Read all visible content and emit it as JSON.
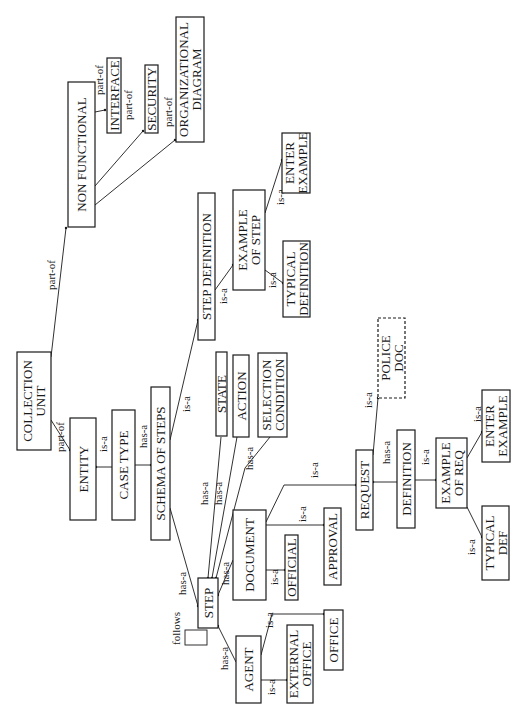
{
  "diagram": {
    "type": "semantic-network",
    "orientation": "rotated-90-ccw",
    "colors": {
      "ink": "#1a1a1a",
      "background": "#ffffff"
    },
    "nodes": [
      {
        "id": "non-functional",
        "lines": [
          "NON    FUNCTIONAL"
        ],
        "x": 68,
        "y": 82,
        "w": 27,
        "h": 145
      },
      {
        "id": "interface",
        "lines": [
          "INTERFACE"
        ],
        "x": 107,
        "y": 58,
        "w": 14,
        "h": 75
      },
      {
        "id": "security",
        "lines": [
          "SECURITY"
        ],
        "x": 145,
        "y": 65,
        "w": 13,
        "h": 68
      },
      {
        "id": "organizational-diagram",
        "lines": [
          "ORGANIZATIONAL",
          "DIAGRAM"
        ],
        "x": 176,
        "y": 17,
        "w": 28,
        "h": 125
      },
      {
        "id": "collection-unit",
        "lines": [
          "COLLECTION",
          "UNIT"
        ],
        "x": 17,
        "y": 352,
        "w": 34,
        "h": 98
      },
      {
        "id": "entity",
        "lines": [
          "ENTITY"
        ],
        "x": 70,
        "y": 418,
        "w": 26,
        "h": 102
      },
      {
        "id": "case-type",
        "lines": [
          "CASE  TYPE"
        ],
        "x": 112,
        "y": 410,
        "w": 23,
        "h": 110
      },
      {
        "id": "schema-of-steps",
        "lines": [
          "SCHEMA  OF  STEPS"
        ],
        "x": 151,
        "y": 387,
        "w": 19,
        "h": 153
      },
      {
        "id": "step-definition",
        "lines": [
          "STEP    DEFINITION"
        ],
        "x": 198,
        "y": 193,
        "w": 17,
        "h": 147
      },
      {
        "id": "example-of-step",
        "lines": [
          "EXAMPLE",
          "OF  STEP"
        ],
        "x": 233,
        "y": 190,
        "w": 32,
        "h": 100
      },
      {
        "id": "enter-example-step",
        "lines": [
          "ENTER",
          "EXAMPLE"
        ],
        "x": 282,
        "y": 133,
        "w": 28,
        "h": 60
      },
      {
        "id": "typical-definition",
        "lines": [
          "TYPICAL",
          "DEFINITION"
        ],
        "x": 283,
        "y": 241,
        "w": 27,
        "h": 76
      },
      {
        "id": "state",
        "lines": [
          "STATE"
        ],
        "x": 216,
        "y": 352,
        "w": 11,
        "h": 84
      },
      {
        "id": "action",
        "lines": [
          "ACTION"
        ],
        "x": 233,
        "y": 355,
        "w": 16,
        "h": 82
      },
      {
        "id": "selection-condition",
        "lines": [
          "SELECTION",
          "CONDITION"
        ],
        "x": 258,
        "y": 353,
        "w": 29,
        "h": 84
      },
      {
        "id": "police-doc",
        "lines": [
          "POLICE",
          "DOC"
        ],
        "x": 378,
        "y": 318,
        "w": 27,
        "h": 80,
        "dashed": true
      },
      {
        "id": "request",
        "lines": [
          "REQUEST"
        ],
        "x": 356,
        "y": 450,
        "w": 17,
        "h": 80
      },
      {
        "id": "definition",
        "lines": [
          "DEFINITION"
        ],
        "x": 397,
        "y": 430,
        "w": 18,
        "h": 98
      },
      {
        "id": "example-of-req",
        "lines": [
          "EXAMPLE",
          "OF REQ"
        ],
        "x": 436,
        "y": 438,
        "w": 31,
        "h": 70
      },
      {
        "id": "enter-example-req",
        "lines": [
          "ENTER",
          "EXAMPLE"
        ],
        "x": 482,
        "y": 390,
        "w": 28,
        "h": 72
      },
      {
        "id": "typical-def",
        "lines": [
          "TYPICAL",
          "DEF"
        ],
        "x": 482,
        "y": 506,
        "w": 27,
        "h": 74
      },
      {
        "id": "document",
        "lines": [
          "DOCUMENT"
        ],
        "x": 233,
        "y": 510,
        "w": 33,
        "h": 90
      },
      {
        "id": "official",
        "lines": [
          "OFFICIAL"
        ],
        "x": 285,
        "y": 535,
        "w": 13,
        "h": 65
      },
      {
        "id": "approval",
        "lines": [
          "APPROVAL"
        ],
        "x": 324,
        "y": 508,
        "w": 17,
        "h": 77
      },
      {
        "id": "step",
        "lines": [
          "STEP"
        ],
        "x": 198,
        "y": 578,
        "w": 20,
        "h": 50
      },
      {
        "id": "agent",
        "lines": [
          "AGENT"
        ],
        "x": 236,
        "y": 636,
        "w": 25,
        "h": 67
      },
      {
        "id": "external-office",
        "lines": [
          "EXTERNAL",
          "OFFICE"
        ],
        "x": 287,
        "y": 625,
        "w": 26,
        "h": 78
      },
      {
        "id": "office",
        "lines": [
          "OFFICE"
        ],
        "x": 324,
        "y": 610,
        "w": 19,
        "h": 60
      }
    ],
    "edges": [
      {
        "label": "part-of",
        "points": [
          [
            95,
            112
          ],
          [
            105,
            110
          ]
        ],
        "lx": 103,
        "ly": 95
      },
      {
        "label": "part-of",
        "points": [
          [
            95,
            186
          ],
          [
            143,
            131
          ]
        ],
        "lx": 132,
        "ly": 120
      },
      {
        "label": "part-of",
        "points": [
          [
            95,
            205
          ],
          [
            175,
            140
          ]
        ],
        "lx": 172,
        "ly": 127
      },
      {
        "label": "part-of",
        "points": [
          [
            51,
            357
          ],
          [
            66,
            228
          ]
        ],
        "lx": 55,
        "ly": 290
      },
      {
        "label": "part-of",
        "points": [
          [
            51,
            420
          ],
          [
            70,
            450
          ]
        ],
        "lx": 64,
        "ly": 452
      },
      {
        "label": "is-a",
        "points": [
          [
            112,
            467
          ],
          [
            96,
            467
          ]
        ],
        "lx": 107,
        "ly": 452
      },
      {
        "label": "has-a",
        "points": [
          [
            135,
            465
          ],
          [
            151,
            465
          ]
        ],
        "lx": 147,
        "ly": 448
      },
      {
        "label": "is-a",
        "points": [
          [
            170,
            440
          ],
          [
            198,
            320
          ]
        ],
        "lx": 190,
        "ly": 412
      },
      {
        "label": "is-a",
        "points": [
          [
            215,
            290
          ],
          [
            233,
            265
          ]
        ],
        "lx": 227,
        "ly": 304
      },
      {
        "label": "is-a",
        "points": [
          [
            265,
            213
          ],
          [
            282,
            160
          ]
        ],
        "lx": 284,
        "ly": 205
      },
      {
        "label": "is-a",
        "points": [
          [
            265,
            270
          ],
          [
            283,
            283
          ]
        ],
        "lx": 276,
        "ly": 288
      },
      {
        "label": "has-a",
        "points": [
          [
            170,
            508
          ],
          [
            198,
            606
          ]
        ],
        "lx": 186,
        "ly": 595
      },
      {
        "label": "has-a",
        "points": [
          [
            221,
            437
          ],
          [
            208,
            578
          ]
        ],
        "lx": 208,
        "ly": 505
      },
      {
        "label": "has-a",
        "points": [
          [
            237,
            437
          ],
          [
            212,
            578
          ]
        ],
        "lx": 222,
        "ly": 505
      },
      {
        "label": "has-a",
        "points": [
          [
            270,
            437
          ],
          [
            245,
            468
          ],
          [
            216,
            578
          ]
        ],
        "lx": 253,
        "ly": 470
      },
      {
        "label": "has-a",
        "points": [
          [
            233,
            560
          ],
          [
            218,
            595
          ]
        ],
        "lx": 229,
        "ly": 585
      },
      {
        "label": "has-a",
        "points": [
          [
            236,
            662
          ],
          [
            218,
            626
          ]
        ],
        "lx": 228,
        "ly": 670
      },
      {
        "label": "is-a",
        "points": [
          [
            266,
            522
          ],
          [
            284,
            485
          ],
          [
            356,
            485
          ]
        ],
        "lx": 318,
        "ly": 478
      },
      {
        "label": "is-a",
        "points": [
          [
            266,
            570
          ],
          [
            285,
            570
          ]
        ],
        "lx": 278,
        "ly": 585
      },
      {
        "label": "is-a",
        "points": [
          [
            266,
            525
          ],
          [
            324,
            525
          ]
        ],
        "lx": 306,
        "ly": 522
      },
      {
        "label": "is-a",
        "points": [
          [
            261,
            680
          ],
          [
            287,
            680
          ]
        ],
        "lx": 275,
        "ly": 695
      },
      {
        "label": "is-a",
        "points": [
          [
            261,
            655
          ],
          [
            272,
            614
          ],
          [
            324,
            614
          ]
        ],
        "lx": 273,
        "ly": 628
      },
      {
        "label": "is-a",
        "points": [
          [
            373,
            455
          ],
          [
            378,
            398
          ]
        ],
        "lx": 372,
        "ly": 408
      },
      {
        "label": "has-a",
        "points": [
          [
            397,
            482
          ],
          [
            373,
            482
          ]
        ],
        "lx": 390,
        "ly": 464
      },
      {
        "label": "is-a",
        "points": [
          [
            415,
            480
          ],
          [
            436,
            480
          ]
        ],
        "lx": 429,
        "ly": 465
      },
      {
        "label": "is-a",
        "points": [
          [
            467,
            458
          ],
          [
            482,
            432
          ]
        ],
        "lx": 481,
        "ly": 422
      },
      {
        "label": "is-a",
        "points": [
          [
            467,
            507
          ],
          [
            482,
            537
          ]
        ],
        "lx": 475,
        "ly": 555
      }
    ],
    "self_loop": {
      "label": "follows",
      "x": 185,
      "y": 630,
      "w": 22,
      "h": 15,
      "lx": 180,
      "ly": 645
    }
  }
}
